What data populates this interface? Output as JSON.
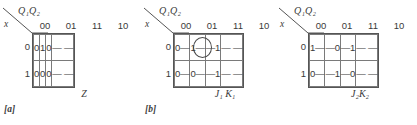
{
  "figure": {
    "axis": {
      "col_var": "Q₁Q₂",
      "row_var": "x",
      "col_headers": [
        "00",
        "01",
        "11",
        "10"
      ],
      "row_headers": [
        "0",
        "1"
      ]
    },
    "line_color": "#555555",
    "text_color": "#3a3a3a",
    "maps": [
      {
        "id": "map-a",
        "fig_label": "[a]",
        "caption": "Z",
        "rows": [
          {
            "row_header": "0",
            "cells": [
              {
                "value": "0",
                "circled": false
              },
              {
                "value": "1",
                "circled": false
              },
              {
                "value": "0",
                "circled": false
              },
              {
                "value": "— —",
                "circled": false
              }
            ]
          },
          {
            "row_header": "1",
            "cells": [
              {
                "value": "0",
                "circled": false
              },
              {
                "value": "0",
                "circled": false
              },
              {
                "value": "0",
                "circled": false
              },
              {
                "value": "— —",
                "circled": false
              }
            ]
          }
        ]
      },
      {
        "id": "map-b",
        "fig_label": "[b]",
        "caption": "J₁ K₁",
        "rows": [
          {
            "row_header": "0",
            "cells": [
              {
                "value": "0—",
                "circled": false
              },
              {
                "value": "1—",
                "circled": true
              },
              {
                "value": "—1",
                "circled": false
              },
              {
                "value": "— —",
                "circled": false
              }
            ]
          },
          {
            "row_header": "1",
            "cells": [
              {
                "value": "0—",
                "circled": false
              },
              {
                "value": "0—",
                "circled": false
              },
              {
                "value": "—1",
                "circled": false
              },
              {
                "value": "— —",
                "circled": false
              }
            ]
          }
        ]
      },
      {
        "id": "map-c",
        "fig_label": "",
        "caption": "J₂K₂",
        "rows": [
          {
            "row_header": "0",
            "cells": [
              {
                "value": "1—",
                "circled": false
              },
              {
                "value": "—0",
                "circled": false
              },
              {
                "value": "—1",
                "circled": false
              },
              {
                "value": "— —",
                "circled": false
              }
            ]
          },
          {
            "row_header": "1",
            "cells": [
              {
                "value": "0—",
                "circled": false
              },
              {
                "value": "—1",
                "circled": false
              },
              {
                "value": "—0",
                "circled": false
              },
              {
                "value": "— —",
                "circled": false
              }
            ]
          }
        ]
      }
    ]
  }
}
